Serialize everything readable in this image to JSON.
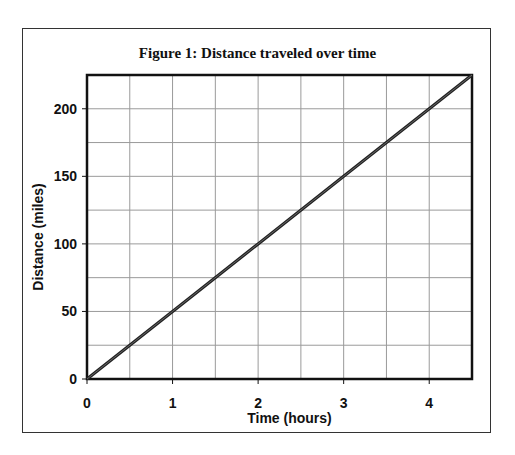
{
  "chart_data": {
    "type": "line",
    "title": "Figure 1: Distance traveled over time",
    "xlabel": "Time (hours)",
    "ylabel": "Distance (miles)",
    "xlim": [
      0,
      4.5
    ],
    "ylim": [
      0,
      225
    ],
    "x_ticks": [
      0,
      1,
      2,
      3,
      4
    ],
    "y_ticks": [
      0,
      50,
      100,
      150,
      200
    ],
    "x_grid_step": 0.5,
    "y_grid_step": 25,
    "grid": true,
    "legend": null,
    "series": [
      {
        "name": "Distance",
        "x": [
          0,
          1,
          2,
          3,
          4,
          4.5
        ],
        "y": [
          0,
          50,
          100,
          150,
          200,
          225
        ],
        "color": "#222222"
      }
    ]
  }
}
